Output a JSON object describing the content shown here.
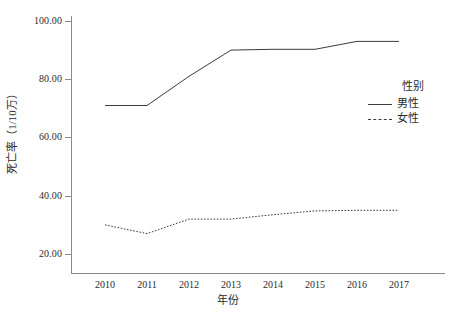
{
  "chart_data": {
    "type": "line",
    "title": "",
    "xlabel": "年份",
    "ylabel": "死亡率（1/10万）",
    "categories": [
      "2010",
      "2011",
      "2012",
      "2013",
      "2014",
      "2015",
      "2016",
      "2017"
    ],
    "x": [
      2010,
      2011,
      2012,
      2013,
      2014,
      2015,
      2016,
      2017
    ],
    "series": [
      {
        "name": "男性",
        "style": "solid",
        "color": "#3b3b3b",
        "values": [
          71.0,
          71.0,
          81.0,
          90.0,
          90.3,
          90.3,
          93.0,
          93.0
        ]
      },
      {
        "name": "女性",
        "style": "dashed",
        "color": "#3b3b3b",
        "values": [
          30.0,
          27.0,
          32.0,
          32.0,
          33.5,
          34.8,
          35.0,
          35.0
        ]
      }
    ],
    "ylim": [
      20.0,
      100.0
    ],
    "yticks": [
      20.0,
      40.0,
      60.0,
      80.0,
      100.0
    ],
    "ytick_labels": [
      "20.00",
      "40.00",
      "60.00",
      "80.00",
      "100.00"
    ],
    "grid": false,
    "legend": {
      "title": "性别",
      "position": "right",
      "entries": [
        {
          "label": "男性",
          "style": "solid"
        },
        {
          "label": "女性",
          "style": "dashed"
        }
      ]
    }
  },
  "axes": {
    "y_tick_labels": [
      "100.00",
      "80.00",
      "60.00",
      "40.00",
      "20.00"
    ],
    "x_tick_labels": [
      "2010",
      "2011",
      "2012",
      "2013",
      "2014",
      "2015",
      "2016",
      "2017"
    ],
    "x_title": "年份",
    "y_title": "死亡率（1/10万）"
  },
  "legend": {
    "title": "性别",
    "entries": [
      {
        "label": "男性"
      },
      {
        "label": "女性"
      }
    ]
  },
  "colors": {
    "line": "#3b3b3b",
    "axis": "#8a8a8a",
    "text": "#2b2b2b",
    "background": "#ffffff"
  }
}
